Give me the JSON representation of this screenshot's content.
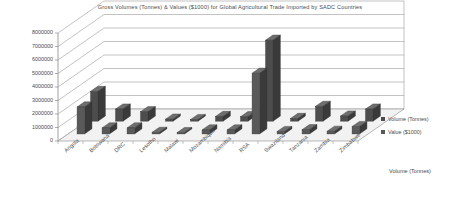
{
  "chart_data": {
    "type": "bar",
    "title": "Gross Volumes (Tonnes) & Values ($1000) for Global Agricultural Trade Imported by SADC Countries",
    "xlabel": "",
    "ylabel": "",
    "depth_axis_label": "Volume (Tonnes)",
    "ylim": [
      0,
      8000000
    ],
    "ytick_labels": [
      "8000000",
      "7000000",
      "6000000",
      "5000000",
      "4000000",
      "3000000",
      "2000000",
      "1000000",
      "0"
    ],
    "ytick_values": [
      8000000,
      7000000,
      6000000,
      5000000,
      4000000,
      3000000,
      2000000,
      1000000,
      0
    ],
    "grid": true,
    "three_d": true,
    "legend_position": "right",
    "categories": [
      "Angola",
      "Botswana",
      "DRC",
      "Lesotho",
      "Malawi",
      "Mozambique",
      "Namibia",
      "RSA",
      "Swaziland",
      "Tanzania",
      "Zambia",
      "Zimbabwe"
    ],
    "series": [
      {
        "name": "Volume (Tonnes)",
        "color": "#4d4d4d",
        "values": [
          2200000,
          900000,
          700000,
          150000,
          120000,
          350000,
          330000,
          6000000,
          200000,
          1100000,
          380000,
          900000
        ]
      },
      {
        "name": "Value ($1000)",
        "color": "#595959",
        "values": [
          2000000,
          450000,
          450000,
          120000,
          100000,
          300000,
          300000,
          4500000,
          180000,
          320000,
          200000,
          550000
        ]
      }
    ]
  },
  "colors": {
    "series_volume": "#4d4d4d",
    "series_value": "#595959",
    "gridline": "#9a9a9a",
    "axis": "#8a8a8a",
    "floor": "#f2f2f2",
    "text": "#4a4a4a"
  }
}
